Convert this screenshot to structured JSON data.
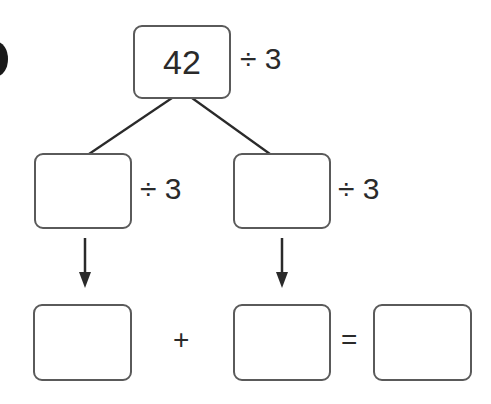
{
  "diagram": {
    "type": "division-split-tree",
    "top": {
      "value": "42",
      "operator": "÷ 3"
    },
    "middle": [
      {
        "value": "",
        "operator": "÷ 3"
      },
      {
        "value": "",
        "operator": "÷ 3"
      }
    ],
    "bottom": {
      "left": "",
      "plus": "+",
      "right": "",
      "equals": "=",
      "result": ""
    }
  }
}
